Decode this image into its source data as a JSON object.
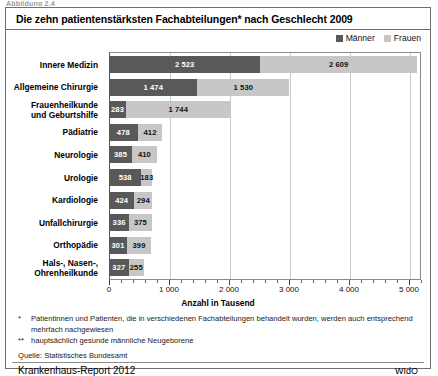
{
  "figure_caption": "Abbildung 2.4",
  "title": "Die zehn patientenstärksten Fachabteilungen* nach Geschlecht 2009",
  "legend": {
    "items": [
      {
        "label": "Männer",
        "color": "#595959"
      },
      {
        "label": "Frauen",
        "color": "#c7c7c7"
      }
    ]
  },
  "axis": {
    "title": "Anzahl in Tausend",
    "tick_labels": [
      "0",
      "1 000",
      "2 000",
      "3 000",
      "4 000",
      "5 000"
    ],
    "tick_values": [
      0,
      1000,
      2000,
      3000,
      4000,
      5000
    ],
    "max": 5200
  },
  "notes": [
    {
      "mark": "*",
      "text": "Patientinnen und Patienten, die in verschiedenen Fachabteilungen behandelt wurden, werden auch entsprechend mehrfach nachgewiesen"
    },
    {
      "mark": "**",
      "text": "hauptsächlich gesunde männliche Neugeborene"
    }
  ],
  "source": "Quelle: Statistisches Bundesamt",
  "footer": {
    "report": "Krankenhaus-Report 2012",
    "publisher": "WIdO"
  },
  "chart_data": {
    "type": "bar",
    "orientation": "horizontal",
    "stacked": true,
    "title": "Die zehn patientenstärksten Fachabteilungen* nach Geschlecht 2009",
    "xlabel": "Anzahl in Tausend",
    "ylabel": "",
    "xlim": [
      0,
      5200
    ],
    "grid": true,
    "legend_position": "top-right",
    "categories": [
      "Innere Medizin",
      "Allgemeine Chirurgie",
      "Frauenheilkunde und Geburtshilfe",
      "Pädiatrie",
      "Neurologie",
      "Urologie",
      "Kardiologie",
      "Unfallchirurgie",
      "Orthopädie",
      "Hals-, Nasen-, Ohrenheilkunde"
    ],
    "series": [
      {
        "name": "Männer",
        "color": "#595959",
        "values": [
          2523,
          1474,
          283,
          478,
          385,
          538,
          424,
          336,
          301,
          327
        ]
      },
      {
        "name": "Frauen",
        "color": "#c7c7c7",
        "values": [
          2609,
          1530,
          1744,
          412,
          410,
          183,
          294,
          375,
          399,
          255
        ]
      }
    ],
    "value_labels": {
      "Männer": [
        "2 523",
        "1 474",
        "283",
        "478",
        "385",
        "538",
        "424",
        "336",
        "301",
        "327"
      ],
      "Frauen": [
        "2 609",
        "1 530",
        "1 744",
        "412",
        "410",
        "183",
        "294",
        "375",
        "399",
        "255"
      ]
    },
    "annotations": [
      {
        "category": "Frauenheilkunde und Geburtshilfe",
        "series": "Männer",
        "mark": "**"
      }
    ]
  },
  "rows": [
    {
      "label": "Innere Medizin",
      "m": 2523,
      "f": 2609,
      "m_label": "2 523",
      "f_label": "2 609",
      "mark": ""
    },
    {
      "label": "Allgemeine Chirurgie",
      "m": 1474,
      "f": 1530,
      "m_label": "1 474",
      "f_label": "1 530",
      "mark": ""
    },
    {
      "label": "Frauenheilkunde\nund Geburtshilfe",
      "m": 283,
      "f": 1744,
      "m_label": "283",
      "f_label": "1 744",
      "mark": "**"
    },
    {
      "label": "Pädiatrie",
      "m": 478,
      "f": 412,
      "m_label": "478",
      "f_label": "412",
      "mark": ""
    },
    {
      "label": "Neurologie",
      "m": 385,
      "f": 410,
      "m_label": "385",
      "f_label": "410",
      "mark": ""
    },
    {
      "label": "Urologie",
      "m": 538,
      "f": 183,
      "m_label": "538",
      "f_label": "183",
      "mark": ""
    },
    {
      "label": "Kardiologie",
      "m": 424,
      "f": 294,
      "m_label": "424",
      "f_label": "294",
      "mark": ""
    },
    {
      "label": "Unfallchirurgie",
      "m": 336,
      "f": 375,
      "m_label": "336",
      "f_label": "375",
      "mark": ""
    },
    {
      "label": "Orthopädie",
      "m": 301,
      "f": 399,
      "m_label": "301",
      "f_label": "399",
      "mark": ""
    },
    {
      "label": "Hals-, Nasen-,\nOhrenheilkunde",
      "m": 327,
      "f": 255,
      "m_label": "327",
      "f_label": "255",
      "mark": ""
    }
  ]
}
